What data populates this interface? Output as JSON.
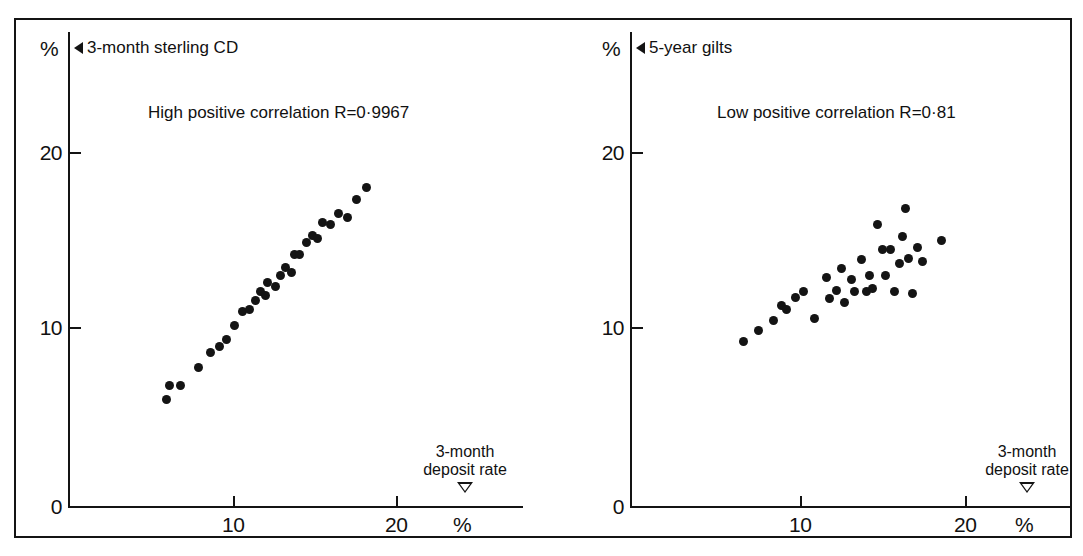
{
  "figure": {
    "background": "#ffffff",
    "ink_color": "#141414",
    "panel_count": 2
  },
  "chart_data": [
    {
      "type": "scatter",
      "panel": "left",
      "title": "3-month sterling CD",
      "series_marker_icon": "triangle-left-marker",
      "annotation": "High positive correlation R=0·9967",
      "correlation_r": 0.9967,
      "correlation_strength": "High positive",
      "xlabel": "3-month deposit rate",
      "xunit": "%",
      "ylabel": "%",
      "xlim": [
        0,
        24.5
      ],
      "ylim": [
        0,
        24.5
      ],
      "xticks": [
        0,
        10,
        20
      ],
      "yticks": [
        0,
        10,
        20
      ],
      "xticklabels": [
        "0",
        "10",
        "20"
      ],
      "yticklabels": [
        "0",
        "10",
        "20"
      ],
      "grid": false,
      "legend": "none",
      "x": [
        5.9,
        6.1,
        6.8,
        7.9,
        8.6,
        9.2,
        9.6,
        10.1,
        10.6,
        11.0,
        11.4,
        11.7,
        12.0,
        12.1,
        12.6,
        12.9,
        13.2,
        13.6,
        13.8,
        14.1,
        14.5,
        14.9,
        15.2,
        15.5,
        16.0,
        16.5,
        17.0,
        17.6,
        18.2
      ],
      "y": [
        6.0,
        6.8,
        6.8,
        7.8,
        8.7,
        9.0,
        9.4,
        10.2,
        11.0,
        11.1,
        11.6,
        12.1,
        11.9,
        12.6,
        12.4,
        13.0,
        13.5,
        13.2,
        14.2,
        14.2,
        14.9,
        15.3,
        15.1,
        16.0,
        15.9,
        16.5,
        16.3,
        17.3,
        18.0
      ]
    },
    {
      "type": "scatter",
      "panel": "right",
      "title": "5-year gilts",
      "series_marker_icon": "triangle-left-marker",
      "annotation": "Low positive correlation R=0·81",
      "correlation_r": 0.81,
      "correlation_strength": "Low positive",
      "xlabel": "3-month deposit rate",
      "xunit": "%",
      "ylabel": "%",
      "xlim": [
        0,
        24.5
      ],
      "ylim": [
        0,
        24.5
      ],
      "xticks": [
        0,
        10,
        20
      ],
      "yticks": [
        0,
        10,
        20
      ],
      "xticklabels": [
        "0",
        "10",
        "20"
      ],
      "yticklabels": [
        "0",
        "10",
        "20"
      ],
      "grid": false,
      "legend": "none",
      "x": [
        6.6,
        7.5,
        8.4,
        8.9,
        9.2,
        9.7,
        10.2,
        10.9,
        11.6,
        11.8,
        12.2,
        12.5,
        12.7,
        13.1,
        13.3,
        13.7,
        14.0,
        14.2,
        14.4,
        14.7,
        15.0,
        15.2,
        15.5,
        15.7,
        16.0,
        16.2,
        16.4,
        16.6,
        16.8,
        17.1,
        17.4,
        18.6
      ],
      "y": [
        9.3,
        9.9,
        10.5,
        11.3,
        11.1,
        11.8,
        12.1,
        10.6,
        12.9,
        11.7,
        12.2,
        13.4,
        11.5,
        12.8,
        12.1,
        13.9,
        12.1,
        13.0,
        12.3,
        15.9,
        14.5,
        13.0,
        14.5,
        12.1,
        13.7,
        15.2,
        16.8,
        14.0,
        12.0,
        14.6,
        13.8,
        15.0
      ]
    }
  ],
  "left_panel": {
    "y_axis_unit": "%",
    "caption": "3-month sterling CD",
    "note": "High positive correlation R=0·9967",
    "x_title_line1": "3-month",
    "x_title_line2": "deposit rate",
    "x_unit": "%",
    "tick_0": "0",
    "tick_10": "10",
    "tick_20": "20",
    "x_tick_10": "10",
    "x_tick_20": "20"
  },
  "right_panel": {
    "y_axis_unit": "%",
    "caption": "5-year gilts",
    "note": "Low positive correlation R=0·81",
    "x_title_line1": "3-month",
    "x_title_line2": "deposit rate",
    "x_unit": "%",
    "tick_0": "0",
    "tick_10": "10",
    "tick_20": "20",
    "x_tick_10": "10",
    "x_tick_20": "20"
  }
}
